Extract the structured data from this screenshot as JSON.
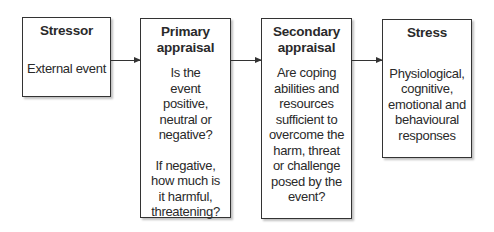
{
  "boxes": [
    {
      "title": "Stressor",
      "body": [
        "External event"
      ]
    },
    {
      "title": "Primary appraisal",
      "body": [
        "Is the event positive, neutral or negative?",
        "If negative, how much is it harmful, threatening?"
      ]
    },
    {
      "title": "Secondary appraisal",
      "body": [
        "Are coping abilities and resources sufficient to overcome the harm, threat or challenge posed by the event?"
      ]
    },
    {
      "title": "Stress",
      "body": [
        "Physiological, cognitive, emotional and behavioural responses"
      ]
    }
  ]
}
